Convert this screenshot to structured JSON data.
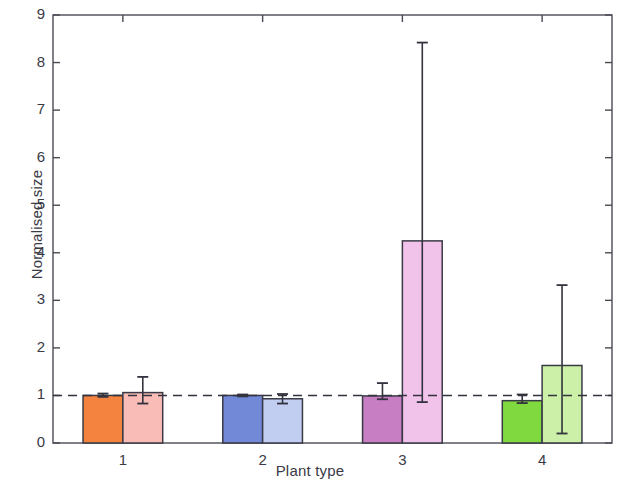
{
  "chart_data": {
    "type": "bar",
    "title": "",
    "subtitle": "",
    "xlabel": "Plant type",
    "ylabel": "Normalised size",
    "categories": [
      "1",
      "2",
      "3",
      "4"
    ],
    "xtick_labels": [
      "1",
      "2",
      "3",
      "4"
    ],
    "ytick_labels": [
      "0",
      "1",
      "2",
      "3",
      "4",
      "5",
      "6",
      "7",
      "8",
      "9"
    ],
    "yticks": [
      0,
      1,
      2,
      3,
      4,
      5,
      6,
      7,
      8,
      9
    ],
    "ylim": [
      0,
      9
    ],
    "grid": false,
    "legend": null,
    "reference_line": {
      "y": 1,
      "style": "dashed",
      "color": "#33333f"
    },
    "series": [
      {
        "name": "dark",
        "values": [
          1.0,
          1.0,
          0.99,
          0.89
        ],
        "err_upper": [
          1.04,
          1.02,
          1.26,
          1.02
        ],
        "err_lower": [
          0.97,
          0.98,
          0.92,
          0.84
        ],
        "colors": [
          "#f4833f",
          "#7289d8",
          "#c77ec2",
          "#7fd93f"
        ]
      },
      {
        "name": "light",
        "values": [
          1.06,
          0.93,
          4.25,
          1.63
        ],
        "err_upper": [
          1.39,
          1.03,
          8.42,
          3.32
        ],
        "err_lower": [
          0.83,
          0.83,
          0.86,
          0.2
        ],
        "colors": [
          "#f9bcb6",
          "#c2cdf2",
          "#f2c3ea",
          "#ccf0a8"
        ]
      }
    ],
    "bar_edge_color": "#3a3a46",
    "error_bar_color": "#33333f",
    "axis_color": "#4a4a55"
  }
}
